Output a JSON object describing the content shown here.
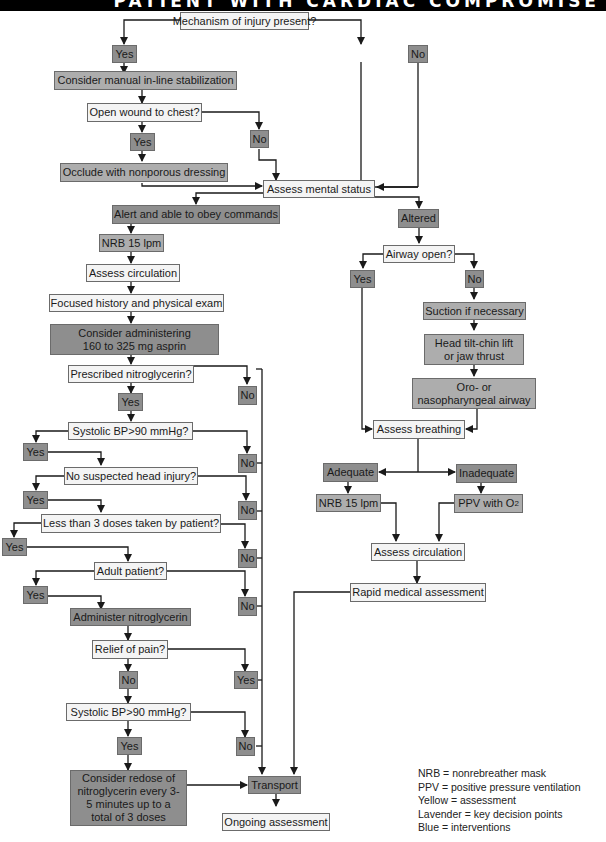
{
  "header": {
    "title": "PATIENT WITH CARDIAC COMPROMISE"
  },
  "colors": {
    "assessment": "#f4f4f4",
    "decision": "#8e8e8e",
    "intervention": "#adadad",
    "line": "#1a1a1a",
    "header_band": "#000000"
  },
  "nodes": {
    "mechanism": "Mechanism of injury present?",
    "mech_yes": "Yes",
    "mech_no": "No",
    "inline_stab": "Consider manual in-line stabilization",
    "open_wound": "Open wound to chest?",
    "wound_yes": "Yes",
    "wound_no": "No",
    "occlude": "Occlude with nonporous dressing",
    "mental_status": "Assess mental status",
    "alert": "Alert and able to obey commands",
    "altered": "Altered",
    "nrb_left": "NRB 15 lpm",
    "assess_circ_left": "Assess circulation",
    "focused_hx": "Focused history and physical exam",
    "aspirin_line1": "Consider administering",
    "aspirin_line2": "160 to 325 mg asprin",
    "prescribed_ntg": "Prescribed nitroglycerin?",
    "ntg_yes": "Yes",
    "ntg_no": "No",
    "sbp1": "Systolic BP>90 mmHg?",
    "sbp1_yes": "Yes",
    "sbp1_no": "No",
    "head_injury": "No suspected head injury?",
    "head_yes": "Yes",
    "head_no": "No",
    "doses": "Less than 3 doses taken by patient?",
    "doses_yes": "Yes",
    "doses_no": "No",
    "adult": "Adult patient?",
    "adult_yes": "Yes",
    "adult_no": "No",
    "administer_ntg": "Administer nitroglycerin",
    "relief": "Relief of pain?",
    "relief_no": "No",
    "relief_yes": "Yes",
    "sbp2": "Systolic BP>90 mmHg?",
    "sbp2_yes": "Yes",
    "sbp2_no": "No",
    "redose": "Consider redose of nitroglycerin every 3-5 minutes up to a total of 3 doses",
    "transport": "Transport",
    "ongoing": "Ongoing assessment",
    "airway_open": "Airway open?",
    "airway_yes": "Yes",
    "airway_no": "No",
    "suction": "Suction if necessary",
    "head_tilt": "Head tilt-chin lift or jaw thrust",
    "opa_npa": "Oro- or nasopharyngeal airway",
    "assess_breathing": "Assess breathing",
    "adequate": "Adequate",
    "inadequate": "Inadequate",
    "nrb_right": "NRB 15 lpm",
    "ppv_prefix": "PPV with O",
    "ppv_sub": "2",
    "assess_circ_right": "Assess circulation",
    "rapid_medical": "Rapid medical assessment"
  },
  "legend": [
    "NRB = nonrebreather mask",
    "PPV = positive pressure ventilation",
    "Yellow = assessment",
    "Lavender = key decision points",
    "Blue = interventions"
  ]
}
